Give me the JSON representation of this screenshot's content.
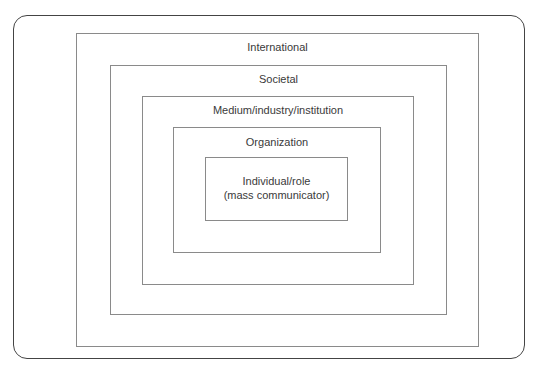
{
  "diagram": {
    "type": "nested-levels",
    "levels": [
      {
        "label": "International"
      },
      {
        "label": "Societal"
      },
      {
        "label": "Medium/industry/institution"
      },
      {
        "label": "Organization"
      },
      {
        "label_line1": "Individual/role",
        "label_line2": "(mass communicator)"
      }
    ]
  }
}
